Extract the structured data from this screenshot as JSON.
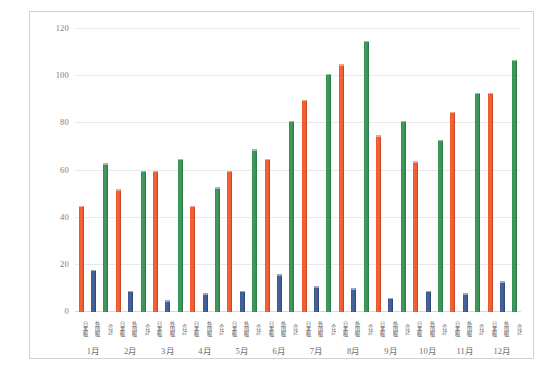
{
  "chart_data": {
    "type": "bar",
    "title": "",
    "subtitle": "",
    "xlabel": "",
    "ylabel": "",
    "ylim": [
      0,
      120
    ],
    "ytick_values": [
      120,
      100,
      80,
      60,
      40,
      20,
      0
    ],
    "ytick_labels": [
      "120",
      "100",
      "80",
      "60",
      "40",
      "20",
      "0"
    ],
    "grid": true,
    "legend": "none",
    "categories": [
      "1月",
      "2月",
      "3月",
      "4月",
      "5月",
      "6月",
      "7月",
      "8月",
      "9月",
      "10月",
      "11月",
      "12月"
    ],
    "series": [
      {
        "name": "日本糍",
        "color": "#ed5c32",
        "values": [
          45,
          52,
          60,
          45,
          60,
          65,
          90,
          105,
          75,
          64,
          85,
          93
        ]
      },
      {
        "name": "外国糍",
        "color": "#415d95",
        "values": [
          18,
          9,
          5,
          8,
          9,
          16,
          11,
          10,
          6,
          9,
          8,
          13
        ]
      },
      {
        "name": "合計",
        "color": "#3a9257",
        "values": [
          63,
          60,
          65,
          53,
          69,
          81,
          101,
          115,
          81,
          73,
          93,
          107
        ]
      }
    ],
    "series_label_order": [
      "日本糍",
      "外国糍",
      "合計"
    ],
    "colors": {
      "series_japanese": "#ed5c32",
      "series_foreign": "#415d95",
      "series_total": "#3a9257",
      "gridline": "#e8e8e8",
      "axis_text": "#7d7d7d",
      "frame_border": "#d2d2d2",
      "plot_background": "#ffffff"
    }
  }
}
